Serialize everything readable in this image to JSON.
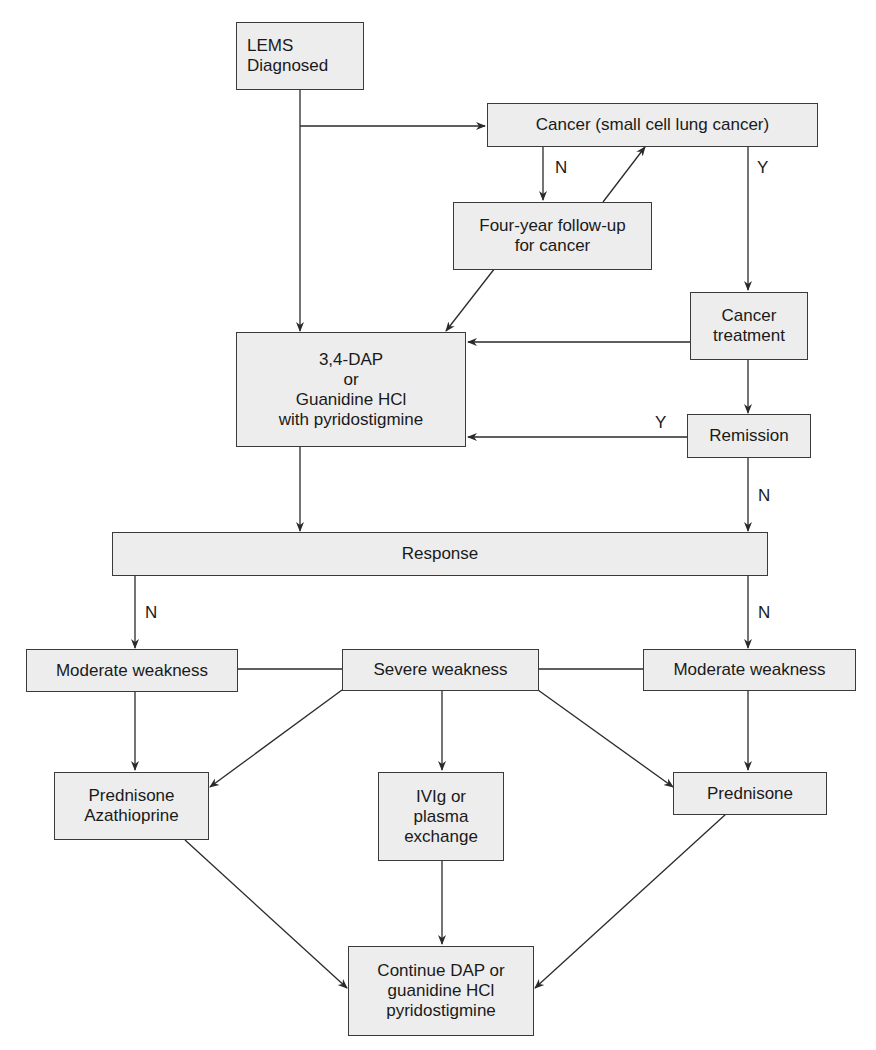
{
  "diagram": {
    "type": "flowchart",
    "colors": {
      "box_fill": "#ededed",
      "box_border": "#3a3a3a",
      "line": "#2a2a2a",
      "text": "#1a1a1a"
    },
    "nodes": {
      "lems_diagnosed": "LEMS\nDiagnosed",
      "cancer": "Cancer (small cell lung cancer)",
      "followup": "Four-year follow-up\nfor cancer",
      "dap": "3,4-DAP\nor\nGuanidine HCl\nwith pyridostigmine",
      "cancer_treatment": "Cancer\ntreatment",
      "remission": "Remission",
      "response": "Response",
      "moderate_left": "Moderate weakness",
      "severe": "Severe weakness",
      "moderate_right": "Moderate weakness",
      "pred_aza": "Prednisone\nAzathioprine",
      "ivig": "IVIg or\nplasma\nexchange",
      "prednisone": "Prednisone",
      "continue": "Continue DAP or\nguanidine HCl\npyridostigmine"
    },
    "edge_labels": {
      "cancer_no": "N",
      "cancer_yes": "Y",
      "remission_yes": "Y",
      "remission_no": "N",
      "response_no_left": "N",
      "response_no_right": "N"
    },
    "edges": [
      {
        "from": "lems_diagnosed",
        "to": "cancer"
      },
      {
        "from": "lems_diagnosed",
        "to": "dap"
      },
      {
        "from": "cancer",
        "to": "followup",
        "label": "N"
      },
      {
        "from": "followup",
        "to": "cancer"
      },
      {
        "from": "followup",
        "to": "dap"
      },
      {
        "from": "cancer",
        "to": "cancer_treatment",
        "label": "Y"
      },
      {
        "from": "cancer_treatment",
        "to": "dap"
      },
      {
        "from": "cancer_treatment",
        "to": "remission"
      },
      {
        "from": "remission",
        "to": "dap",
        "label": "Y"
      },
      {
        "from": "remission",
        "to": "response",
        "label": "N"
      },
      {
        "from": "dap",
        "to": "response"
      },
      {
        "from": "response",
        "to": "moderate_left",
        "label": "N"
      },
      {
        "from": "response",
        "to": "moderate_right",
        "label": "N"
      },
      {
        "from": "moderate_left",
        "to": "severe",
        "style": "line"
      },
      {
        "from": "severe",
        "to": "moderate_right",
        "style": "line"
      },
      {
        "from": "moderate_left",
        "to": "pred_aza"
      },
      {
        "from": "severe",
        "to": "pred_aza"
      },
      {
        "from": "severe",
        "to": "ivig"
      },
      {
        "from": "severe",
        "to": "prednisone"
      },
      {
        "from": "moderate_right",
        "to": "prednisone"
      },
      {
        "from": "pred_aza",
        "to": "continue"
      },
      {
        "from": "ivig",
        "to": "continue"
      },
      {
        "from": "prednisone",
        "to": "continue"
      }
    ]
  }
}
